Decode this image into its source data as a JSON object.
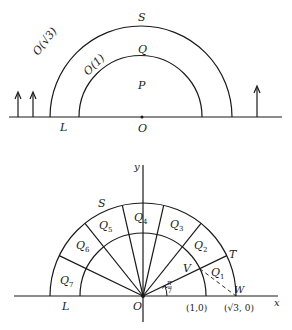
{
  "figure_a": {
    "labels": {
      "outer_arc": "O(√3)",
      "inner_arc": "O(1)",
      "S": "S",
      "Q": "Q",
      "P": "P",
      "L": "L",
      "O": "O"
    }
  },
  "figure_b": {
    "axis_labels": {
      "x": "x",
      "y": "y"
    },
    "labels": {
      "S": "S",
      "T": "T",
      "V": "V",
      "W": "W",
      "L": "L",
      "O": "O",
      "angle": "π/7",
      "angle_num": "π",
      "angle_den": "7",
      "point_1_0": "(1,0)",
      "point_sqrt3_0": "(√3, 0)"
    },
    "sectors": [
      {
        "name": "Q",
        "sub": "1"
      },
      {
        "name": "Q",
        "sub": "2"
      },
      {
        "name": "Q",
        "sub": "3"
      },
      {
        "name": "Q",
        "sub": "4"
      },
      {
        "name": "Q",
        "sub": "5"
      },
      {
        "name": "Q",
        "sub": "6"
      },
      {
        "name": "Q",
        "sub": "7"
      }
    ]
  }
}
